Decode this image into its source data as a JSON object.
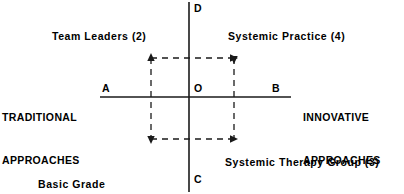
{
  "diagram": {
    "type": "two-axis-quadrant-diagram",
    "background_color": "#ffffff",
    "line_color": "#1a1a1a",
    "axes": {
      "vertical": {
        "top_letter": "D",
        "bottom_letter": "C"
      },
      "horizontal": {
        "left_letter": "A",
        "right_letter": "B",
        "origin_letter": "O",
        "left_pole_label_line1": "TRADITIONAL",
        "left_pole_label_line2": "APPROACHES",
        "right_pole_label_line1": "INNOVATIVE",
        "right_pole_label_line2": "APPROACHES"
      }
    },
    "quadrant_labels": {
      "top_left": "Team Leaders (2)",
      "top_right": "Systemic Practice (4)",
      "bottom_left_line1": "Basic Grade",
      "bottom_left_line2": "Social Workers (1)",
      "bottom_right": "Systemic Therapy Group (3)"
    },
    "flow_path": {
      "style": "dashed-rectangle-with-arrowheads",
      "arrow_corners": [
        "top-left-up",
        "top-right-right",
        "bottom-left-down",
        "bottom-right-right"
      ]
    }
  }
}
